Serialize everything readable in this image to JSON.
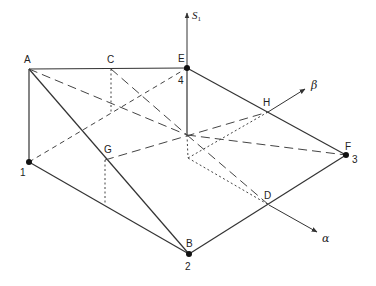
{
  "diagram": {
    "type": "3d-geometric-figure",
    "colors": {
      "line": "#333333",
      "point": "#111111",
      "background": "#ffffff"
    },
    "axes": [
      {
        "id": "s1",
        "label": "S",
        "subscript": "1",
        "from": [
          187,
          135
        ],
        "to": [
          187,
          12
        ]
      },
      {
        "id": "beta",
        "label": "β",
        "from": [
          187,
          135
        ],
        "to": [
          305,
          89
        ]
      },
      {
        "id": "alpha",
        "label": "α",
        "from": [
          187,
          135
        ],
        "to": [
          317,
          232
        ]
      }
    ],
    "points": [
      {
        "id": "A",
        "label": "A",
        "x": 29,
        "y": 69,
        "dot": false
      },
      {
        "id": "C",
        "label": "C",
        "x": 111,
        "y": 69,
        "dot": false
      },
      {
        "id": "E",
        "label": "E",
        "number": "4",
        "x": 187,
        "y": 68,
        "dot": true
      },
      {
        "id": "H",
        "label": "H",
        "x": 268,
        "y": 112,
        "dot": false
      },
      {
        "id": "F",
        "label": "F",
        "number": "3",
        "x": 346,
        "y": 155,
        "dot": true
      },
      {
        "id": "G",
        "label": "G",
        "x": 105,
        "y": 160,
        "dot": false
      },
      {
        "id": "P1",
        "label": "",
        "number": "1",
        "x": 29,
        "y": 162,
        "dot": true
      },
      {
        "id": "D",
        "label": "D",
        "x": 269,
        "y": 205,
        "dot": false
      },
      {
        "id": "B",
        "label": "B",
        "number": "2",
        "x": 189,
        "y": 254,
        "dot": true
      },
      {
        "id": "O",
        "label": "",
        "x": 187,
        "y": 135,
        "dot": false
      }
    ],
    "solid_edges": [
      [
        "A",
        "E"
      ],
      [
        "A",
        "P1"
      ],
      [
        "A",
        "B"
      ],
      [
        "P1",
        "B"
      ],
      [
        "B",
        "F"
      ],
      [
        "E",
        "F"
      ],
      [
        "E",
        "O"
      ]
    ],
    "dashed_edges": [
      [
        "C",
        "O"
      ],
      [
        "A",
        "O"
      ],
      [
        "G",
        "H"
      ],
      [
        "O",
        "F"
      ],
      [
        "O",
        "D"
      ],
      [
        "P1",
        "E"
      ]
    ],
    "dotted_edges": [
      [
        "C",
        "C_low"
      ],
      [
        "G",
        "G_low"
      ],
      [
        "O",
        "O_low"
      ],
      [
        "O_low",
        "H"
      ],
      [
        "O_low",
        "D"
      ]
    ],
    "aux_points": {
      "C_low": [
        111,
        112
      ],
      "G_low": [
        105,
        205
      ],
      "O_low": [
        188,
        158
      ]
    }
  },
  "labels": {
    "A": "A",
    "C": "C",
    "E": "E",
    "H": "H",
    "F": "F",
    "G": "G",
    "D": "D",
    "B": "B",
    "n1": "1",
    "n2": "2",
    "n3": "3",
    "n4": "4",
    "s_axis": "S",
    "s_axis_sub": "1",
    "beta": "β",
    "alpha": "α"
  }
}
